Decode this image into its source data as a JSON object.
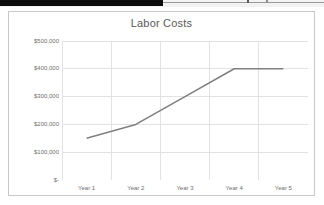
{
  "window": {
    "chrome_strip_color": "#0d0d0d",
    "chrome_background_color": "#f2f2f2"
  },
  "chart_panel": {
    "background_color": "#ffffff",
    "border_color": "#c8c8c8"
  },
  "chart_data": {
    "type": "line",
    "title": "Labor Costs",
    "xlabel": "",
    "ylabel": "",
    "categories": [
      "Year 1",
      "Year 2",
      "Year 3",
      "Year 4",
      "Year 5"
    ],
    "values": [
      150000,
      200000,
      300000,
      400000,
      400000
    ],
    "series": [
      {
        "name": "Labor Costs",
        "values": [
          150000,
          200000,
          300000,
          400000,
          400000
        ],
        "color": "#808080"
      }
    ],
    "ylim": [
      0,
      500000
    ],
    "y_ticks": [
      0,
      100000,
      200000,
      300000,
      400000,
      500000
    ],
    "y_tick_labels": [
      "$-",
      "$100,000",
      "$200,000",
      "$300,000",
      "$400,000",
      "$500,000"
    ],
    "x_tick_labels": [
      "Year 1",
      "Year 2",
      "Year 3",
      "Year 4",
      "Year 5"
    ],
    "grid": {
      "horizontal": true,
      "vertical": true,
      "color": "#e2e2e2"
    },
    "legend": {
      "visible": false,
      "position": "none"
    },
    "markers": false,
    "line_color": "#808080",
    "line_width": 1.6,
    "axis_label_color": "#6e6e6e",
    "title_color": "#5a5a5a"
  }
}
